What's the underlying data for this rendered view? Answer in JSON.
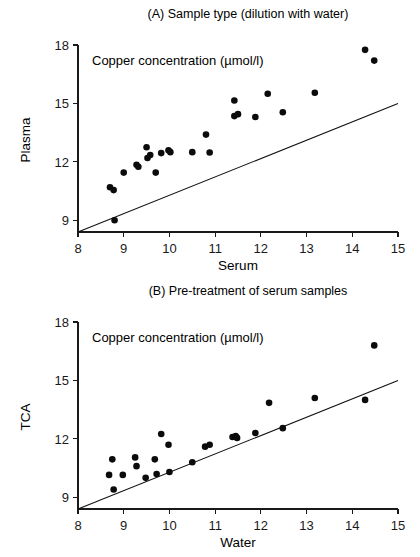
{
  "figure": {
    "background": "#ffffff",
    "ink_color": "#0b0b0b"
  },
  "chart_data": [
    {
      "panel": "A",
      "type": "scatter",
      "title": "(A) Sample type (dilution with water)",
      "annotation": "Copper concentration (µmol/l)",
      "xlabel": "Serum",
      "ylabel": "Plasma",
      "xlim": [
        8,
        15
      ],
      "ylim": [
        8.4,
        18
      ],
      "xticks": [
        8,
        9,
        10,
        11,
        12,
        13,
        14,
        15
      ],
      "xticklabels": [
        "8",
        "9",
        "10",
        "11",
        "12",
        "13",
        "14",
        "15"
      ],
      "yticks": [
        9,
        12,
        15,
        18
      ],
      "yticklabels": [
        "9",
        "12",
        "15",
        "18"
      ],
      "grid": false,
      "legend": "none",
      "reference_line": {
        "name": "line-of-identity",
        "x": [
          8,
          15
        ],
        "y": [
          8.4,
          15.0
        ]
      },
      "points": [
        {
          "x": 8.7,
          "y": 10.7
        },
        {
          "x": 8.78,
          "y": 10.55
        },
        {
          "x": 8.8,
          "y": 9.0
        },
        {
          "x": 9.0,
          "y": 11.45
        },
        {
          "x": 9.28,
          "y": 11.85
        },
        {
          "x": 9.32,
          "y": 11.75
        },
        {
          "x": 9.5,
          "y": 12.75
        },
        {
          "x": 9.52,
          "y": 12.2
        },
        {
          "x": 9.58,
          "y": 12.35
        },
        {
          "x": 9.7,
          "y": 11.45
        },
        {
          "x": 9.82,
          "y": 12.45
        },
        {
          "x": 9.98,
          "y": 12.6
        },
        {
          "x": 10.02,
          "y": 12.5
        },
        {
          "x": 10.5,
          "y": 12.5
        },
        {
          "x": 10.8,
          "y": 13.4
        },
        {
          "x": 10.88,
          "y": 12.48
        },
        {
          "x": 11.42,
          "y": 15.15
        },
        {
          "x": 11.42,
          "y": 14.35
        },
        {
          "x": 11.5,
          "y": 14.45
        },
        {
          "x": 11.88,
          "y": 14.3
        },
        {
          "x": 12.15,
          "y": 15.5
        },
        {
          "x": 12.48,
          "y": 14.55
        },
        {
          "x": 13.18,
          "y": 15.55
        },
        {
          "x": 14.28,
          "y": 17.75
        },
        {
          "x": 14.48,
          "y": 17.2
        }
      ]
    },
    {
      "panel": "B",
      "type": "scatter",
      "title": "(B) Pre-treatment of serum samples",
      "annotation": "Copper concentration (µmol/l)",
      "xlabel": "Water",
      "ylabel": "TCA",
      "xlim": [
        8,
        15
      ],
      "ylim": [
        8.4,
        18
      ],
      "xticks": [
        8,
        9,
        10,
        11,
        12,
        13,
        14,
        15
      ],
      "xticklabels": [
        "8",
        "9",
        "10",
        "11",
        "12",
        "13",
        "14",
        "15"
      ],
      "yticks": [
        9,
        12,
        15,
        18
      ],
      "yticklabels": [
        "9",
        "12",
        "15",
        "18"
      ],
      "grid": false,
      "legend": "none",
      "reference_line": {
        "name": "line-of-identity",
        "x": [
          8,
          15
        ],
        "y": [
          8.4,
          15.0
        ]
      },
      "points": [
        {
          "x": 8.68,
          "y": 10.15
        },
        {
          "x": 8.75,
          "y": 10.95
        },
        {
          "x": 8.78,
          "y": 9.4
        },
        {
          "x": 8.98,
          "y": 10.15
        },
        {
          "x": 9.25,
          "y": 11.05
        },
        {
          "x": 9.28,
          "y": 10.6
        },
        {
          "x": 9.48,
          "y": 10.0
        },
        {
          "x": 9.68,
          "y": 10.95
        },
        {
          "x": 9.72,
          "y": 10.2
        },
        {
          "x": 9.82,
          "y": 12.25
        },
        {
          "x": 9.98,
          "y": 11.7
        },
        {
          "x": 10.0,
          "y": 10.3
        },
        {
          "x": 10.5,
          "y": 10.8
        },
        {
          "x": 10.78,
          "y": 11.6
        },
        {
          "x": 10.88,
          "y": 11.7
        },
        {
          "x": 11.38,
          "y": 12.1
        },
        {
          "x": 11.45,
          "y": 12.15
        },
        {
          "x": 11.48,
          "y": 12.05
        },
        {
          "x": 11.88,
          "y": 12.3
        },
        {
          "x": 12.18,
          "y": 13.85
        },
        {
          "x": 12.48,
          "y": 12.55
        },
        {
          "x": 13.18,
          "y": 14.1
        },
        {
          "x": 14.28,
          "y": 14.0
        },
        {
          "x": 14.48,
          "y": 16.8
        }
      ]
    }
  ]
}
